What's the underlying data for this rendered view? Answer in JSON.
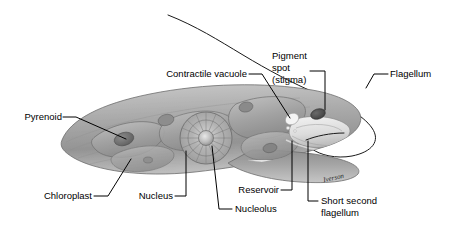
{
  "figure": {
    "signature": "Iverson",
    "background_color": "#ffffff",
    "body_color_mid": "#a9a9a9",
    "body_color_light": "#d8d8d8",
    "body_color_dark": "#6f6f6f",
    "label_color": "#000000",
    "leader_color": "#000000"
  },
  "labels": {
    "pyrenoid": "Pyrenoid",
    "chloroplast": "Chloroplast",
    "nucleus": "Nucleus",
    "nucleolus": "Nucleolus",
    "contractile_vacuole": "Contractile vacuole",
    "pigment_spot_line1": "Pigment",
    "pigment_spot_line2": "spot",
    "pigment_spot_line3": "(stigma)",
    "flagellum": "Flagellum",
    "reservoir": "Reservoir",
    "short_second_flagellum_line1": "Short second",
    "short_second_flagellum_line2": "flagellum"
  }
}
